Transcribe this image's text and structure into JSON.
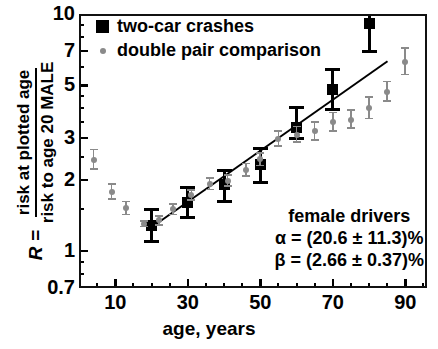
{
  "chart_data": {
    "type": "scatter",
    "title": "",
    "xlabel": "age, years",
    "ylabel": "R = risk at plotted age / risk to age 20 MALE",
    "yscale": "log",
    "xlim": [
      0,
      96
    ],
    "ylim": [
      0.7,
      10
    ],
    "xticks": [
      10,
      30,
      50,
      70,
      90
    ],
    "xtick_labels": [
      "10",
      "30",
      "50",
      "70",
      "90"
    ],
    "yticks": [
      0.7,
      1,
      2,
      3,
      5,
      7,
      10
    ],
    "ytick_labels": [
      "0.7",
      "1",
      "2",
      "3",
      "5",
      "7",
      "10"
    ],
    "grid": false,
    "legend_position": "top-left",
    "series": [
      {
        "name": "two-car crashes",
        "marker": "square",
        "color": "#000000",
        "points": [
          {
            "x": 20,
            "y": 1.28,
            "yerr_low": 1.1,
            "yerr_high": 1.5
          },
          {
            "x": 30,
            "y": 1.6,
            "yerr_low": 1.39,
            "yerr_high": 1.86
          },
          {
            "x": 40,
            "y": 1.92,
            "yerr_low": 1.62,
            "yerr_high": 2.18
          },
          {
            "x": 50,
            "y": 2.33,
            "yerr_low": 1.95,
            "yerr_high": 2.7
          },
          {
            "x": 60,
            "y": 3.32,
            "yerr_low": 2.98,
            "yerr_high": 4.05
          },
          {
            "x": 70,
            "y": 4.8,
            "yerr_low": 3.95,
            "yerr_high": 5.85
          },
          {
            "x": 80,
            "y": 9.1,
            "yerr_low": 6.95,
            "yerr_high": 11.2
          }
        ]
      },
      {
        "name": "double pair comparison",
        "marker": "circle",
        "color": "#8a8a8a",
        "points": [
          {
            "x": 4,
            "y": 2.42,
            "yerr_low": 2.22,
            "yerr_high": 2.68
          },
          {
            "x": 9,
            "y": 1.78,
            "yerr_low": 1.66,
            "yerr_high": 1.92
          },
          {
            "x": 13,
            "y": 1.52,
            "yerr_low": 1.43,
            "yerr_high": 1.62
          },
          {
            "x": 18,
            "y": 1.3,
            "yerr_low": 1.27,
            "yerr_high": 1.34
          },
          {
            "x": 22,
            "y": 1.35,
            "yerr_low": 1.29,
            "yerr_high": 1.41
          },
          {
            "x": 26,
            "y": 1.5,
            "yerr_low": 1.43,
            "yerr_high": 1.58
          },
          {
            "x": 31,
            "y": 1.72,
            "yerr_low": 1.64,
            "yerr_high": 1.81
          },
          {
            "x": 36,
            "y": 1.92,
            "yerr_low": 1.82,
            "yerr_high": 2.03
          },
          {
            "x": 41,
            "y": 1.98,
            "yerr_low": 1.88,
            "yerr_high": 2.09
          },
          {
            "x": 46,
            "y": 2.2,
            "yerr_low": 2.08,
            "yerr_high": 2.34
          },
          {
            "x": 50,
            "y": 2.44,
            "yerr_low": 2.3,
            "yerr_high": 2.6
          },
          {
            "x": 55,
            "y": 2.98,
            "yerr_low": 2.78,
            "yerr_high": 3.22
          },
          {
            "x": 60,
            "y": 3.1,
            "yerr_low": 2.88,
            "yerr_high": 3.35
          },
          {
            "x": 65,
            "y": 3.2,
            "yerr_low": 2.95,
            "yerr_high": 3.5
          },
          {
            "x": 70,
            "y": 3.5,
            "yerr_low": 3.22,
            "yerr_high": 3.85
          },
          {
            "x": 75,
            "y": 3.58,
            "yerr_low": 3.3,
            "yerr_high": 3.95
          },
          {
            "x": 80,
            "y": 4.02,
            "yerr_low": 3.62,
            "yerr_high": 4.48
          },
          {
            "x": 85,
            "y": 4.68,
            "yerr_low": 4.3,
            "yerr_high": 5.2
          },
          {
            "x": 90,
            "y": 6.3,
            "yerr_low": 5.55,
            "yerr_high": 7.2
          }
        ]
      }
    ],
    "fit_line": {
      "name": "fit",
      "color": "#000000",
      "x_start": 20,
      "y_start": 1.27,
      "x_end": 85,
      "y_end": 6.35
    },
    "annotations": [
      "female drivers",
      "α = (20.6 ± 11.3)%",
      "β = (2.66 ± 0.37)%"
    ]
  },
  "legend": {
    "items": [
      {
        "label": "two-car crashes",
        "marker": "square"
      },
      {
        "label": "double pair comparison",
        "marker": "dot"
      }
    ]
  },
  "yaxis_title": {
    "r_symbol": "R =",
    "numerator": "risk at plotted age",
    "denominator": "risk to age 20 MALE"
  },
  "colors": {
    "black": "#000000",
    "gray": "#8a8a8a",
    "background": "#ffffff"
  }
}
